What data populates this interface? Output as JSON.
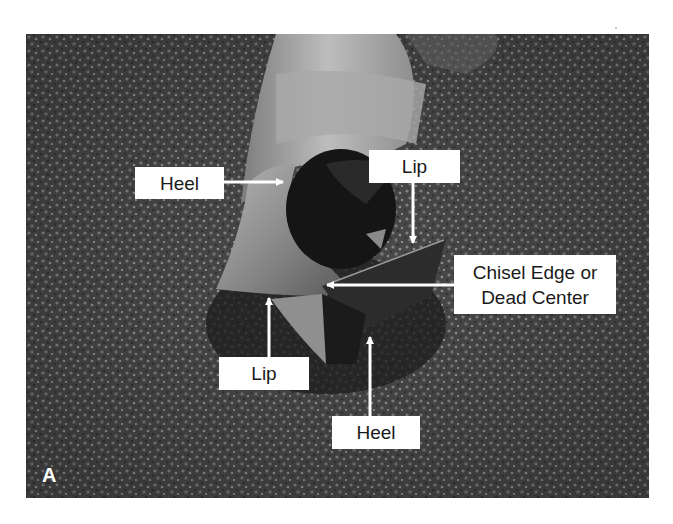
{
  "figure": {
    "panel_letter": "A",
    "labels": [
      {
        "id": "heel-upper",
        "text": "Heel",
        "box": [
          135,
          167,
          224,
          199
        ],
        "arrow_from": [
          224,
          182
        ],
        "arrow_to": [
          283,
          182
        ]
      },
      {
        "id": "lip-upper",
        "text": "Lip",
        "box": [
          369,
          150,
          460,
          183
        ],
        "arrow_from": [
          413,
          183
        ],
        "arrow_to": [
          413,
          243
        ]
      },
      {
        "id": "chisel-edge",
        "text": "Chisel Edge or\nDead Center",
        "lines": [
          "Chisel Edge or",
          "Dead Center"
        ],
        "box": [
          454,
          255,
          616,
          314
        ],
        "arrow_from": [
          454,
          285
        ],
        "arrow_to": [
          327,
          285
        ]
      },
      {
        "id": "lip-lower",
        "text": "Lip",
        "box": [
          219,
          357,
          309,
          390
        ],
        "arrow_from": [
          269,
          357
        ],
        "arrow_to": [
          269,
          298
        ]
      },
      {
        "id": "heel-lower",
        "text": "Heel",
        "box": [
          332,
          416,
          420,
          449
        ],
        "arrow_from": [
          370,
          416
        ],
        "arrow_to": [
          370,
          337
        ]
      }
    ],
    "colors": {
      "background": "#ffffff",
      "photo_base": "#4a4a4a",
      "label_fill": "#ffffff",
      "label_text": "#1a1a1a",
      "arrow": "#ffffff"
    }
  }
}
